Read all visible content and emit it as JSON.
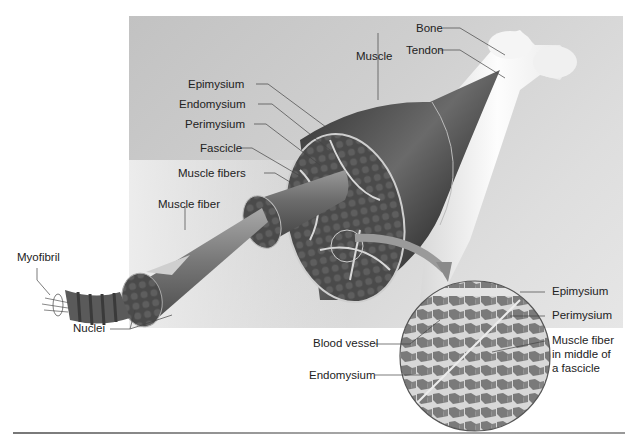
{
  "diagram": {
    "labels": {
      "bone": "Bone",
      "tendon": "Tendon",
      "muscle": "Muscle",
      "epimysium": "Epimysium",
      "endomysium": "Endomysium",
      "perimysium": "Perimysium",
      "fascicle": "Fascicle",
      "muscle_fibers": "Muscle fibers",
      "muscle_fiber": "Muscle fiber",
      "myofibril": "Myofibril",
      "nuclei": "Nuclei"
    },
    "micrograph_labels": {
      "epimysium": "Epimysium",
      "perimysium": "Perimysium",
      "blood_vessel": "Blood vessel",
      "muscle_fiber_middle_line1": "Muscle fiber",
      "muscle_fiber_middle_line2": "in middle of",
      "muscle_fiber_middle_line3": "a fascicle",
      "endomysium": "Endomysium"
    },
    "colors": {
      "background_panel": "#c8c8c8",
      "muscle_dark": "#3a3a3a",
      "tendon_light": "#f2f2f2",
      "micrograph": "#7d7d7d",
      "text": "#222222"
    }
  }
}
